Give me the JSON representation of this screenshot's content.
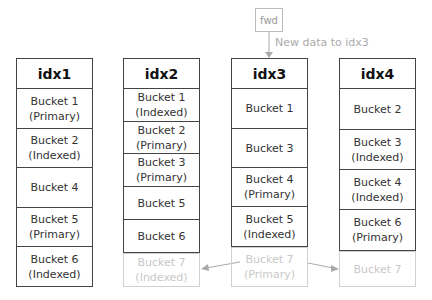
{
  "fwd": {
    "label": "fwd",
    "note": "New data to idx3"
  },
  "columns": [
    {
      "title": "idx1",
      "cells": [
        {
          "l1": "Bucket 1",
          "l2": "(Primary)",
          "h": 40
        },
        {
          "l1": "Bucket 2",
          "l2": "(Indexed)",
          "h": 39
        },
        {
          "l1": "Bucket 4",
          "l2": "",
          "h": 40
        },
        {
          "l1": "Bucket 5",
          "l2": "(Primary)",
          "h": 39
        },
        {
          "l1": "Bucket 6",
          "l2": "(Indexed)",
          "h": 39
        }
      ]
    },
    {
      "title": "idx2",
      "cells": [
        {
          "l1": "Bucket 1",
          "l2": "(Indexed)",
          "h": 33
        },
        {
          "l1": "Bucket 2",
          "l2": "(Primary)",
          "h": 32
        },
        {
          "l1": "Bucket 3",
          "l2": "(Primary)",
          "h": 33
        },
        {
          "l1": "Bucket 5",
          "l2": "",
          "h": 33
        },
        {
          "l1": "Bucket 6",
          "l2": "",
          "h": 33
        },
        {
          "l1": "Bucket 7",
          "l2": "(Indexed)",
          "h": 33,
          "faded": true
        }
      ]
    },
    {
      "title": "idx3",
      "cells": [
        {
          "l1": "Bucket 1",
          "l2": "",
          "h": 40
        },
        {
          "l1": "Bucket 3",
          "l2": "",
          "h": 39
        },
        {
          "l1": "Bucket 4",
          "l2": "(Primary)",
          "h": 39
        },
        {
          "l1": "Bucket 5",
          "l2": "(Indexed)",
          "h": 40
        },
        {
          "l1": "Bucket 7",
          "l2": "(Primary)",
          "h": 39,
          "faded": true
        }
      ]
    },
    {
      "title": "idx4",
      "cells": [
        {
          "l1": "Bucket 2",
          "l2": "",
          "h": 41
        },
        {
          "l1": "Bucket 3",
          "l2": "(Indexed)",
          "h": 40
        },
        {
          "l1": "Bucket 4",
          "l2": "(Indexed)",
          "h": 40
        },
        {
          "l1": "Bucket 6",
          "l2": "(Primary)",
          "h": 41
        },
        {
          "l1": "Bucket 7",
          "l2": "",
          "h": 35,
          "faded": true
        }
      ]
    }
  ]
}
